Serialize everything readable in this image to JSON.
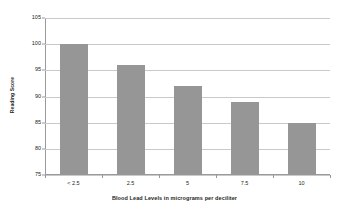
{
  "chart_data": {
    "type": "bar",
    "title": "",
    "categories": [
      "< 2.5",
      "2.5",
      "5",
      "7.5",
      "10"
    ],
    "values": [
      100,
      96,
      92,
      89,
      85
    ],
    "xlabel": "Blood Lead Levels in micrograms per deciliter",
    "ylabel": "Reading Score",
    "ylim": [
      75,
      105
    ],
    "yticks": [
      105,
      100,
      95,
      90,
      85,
      80,
      75
    ],
    "ytick_labels": [
      "105",
      "100",
      "95",
      "90",
      "85",
      "80",
      "75"
    ],
    "grid": true,
    "legend": false,
    "bar_color": "#969696",
    "gridline_color": "#c9c9c9",
    "axis_color": "#9a9a9a",
    "background_color": "#ffffff",
    "text_color": "#231f20"
  }
}
